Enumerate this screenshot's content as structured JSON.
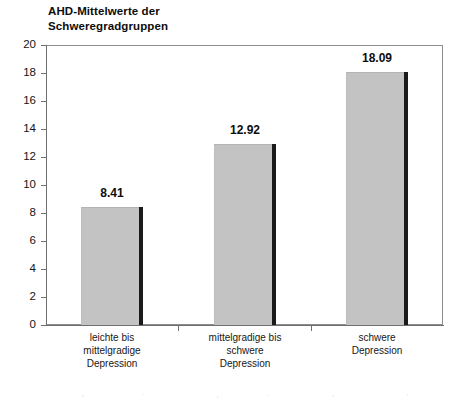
{
  "chart_data": {
    "type": "bar",
    "title": "AHD-Mittelwerte der\nSchweregradgruppen",
    "categories": [
      "leichte bis\nmittelgradige\nDepression",
      "mittelgradige bis\nschwere\nDepression",
      "schwere\nDepression"
    ],
    "values": [
      8.41,
      12.92,
      18.09
    ],
    "value_labels": [
      "8.41",
      "12.92",
      "18.09"
    ],
    "xlabel": "",
    "ylabel": "",
    "ylim": [
      0,
      20
    ],
    "ytick_step": 2,
    "yticks": [
      "20",
      "18",
      "16",
      "14",
      "12",
      "10",
      "8",
      "6",
      "4",
      "2",
      "0"
    ],
    "grid": false,
    "legend": "none",
    "bar_color": "#c3c3c3",
    "bar_shadow_color": "#1a1a1a",
    "axis_color": "#6f6f6f",
    "text_color": "#111111"
  }
}
